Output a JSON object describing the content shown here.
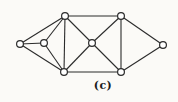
{
  "figure": {
    "caption": "(c)",
    "diagram_type": "undirected-graph",
    "colors": {
      "background": "#fbfaf7",
      "edge": "#2b2b2b",
      "node_fill": "#ffffff",
      "node_stroke": "#2b2b2b",
      "caption_text": "#1c1c1c"
    },
    "node_radius": 3.4,
    "edge_width": 1.1,
    "node_stroke_width": 1.2,
    "nodes": [
      {
        "id": "far-left",
        "x": 20,
        "y": 44
      },
      {
        "id": "mid-left",
        "x": 44,
        "y": 43
      },
      {
        "id": "top-left",
        "x": 65,
        "y": 16
      },
      {
        "id": "bottom-left",
        "x": 64,
        "y": 72
      },
      {
        "id": "center",
        "x": 92,
        "y": 43
      },
      {
        "id": "top-right",
        "x": 121,
        "y": 16
      },
      {
        "id": "bottom-right",
        "x": 121,
        "y": 72
      },
      {
        "id": "far-right",
        "x": 163,
        "y": 45
      }
    ],
    "edges": [
      [
        "far-left",
        "mid-left"
      ],
      [
        "far-left",
        "top-left"
      ],
      [
        "far-left",
        "bottom-left"
      ],
      [
        "mid-left",
        "top-left"
      ],
      [
        "mid-left",
        "bottom-left"
      ],
      [
        "top-left",
        "bottom-left"
      ],
      [
        "top-left",
        "center"
      ],
      [
        "top-left",
        "top-right"
      ],
      [
        "bottom-left",
        "center"
      ],
      [
        "bottom-left",
        "bottom-right"
      ],
      [
        "center",
        "top-right"
      ],
      [
        "center",
        "bottom-right"
      ],
      [
        "top-right",
        "bottom-right"
      ],
      [
        "top-right",
        "far-right"
      ],
      [
        "bottom-right",
        "far-right"
      ]
    ]
  }
}
